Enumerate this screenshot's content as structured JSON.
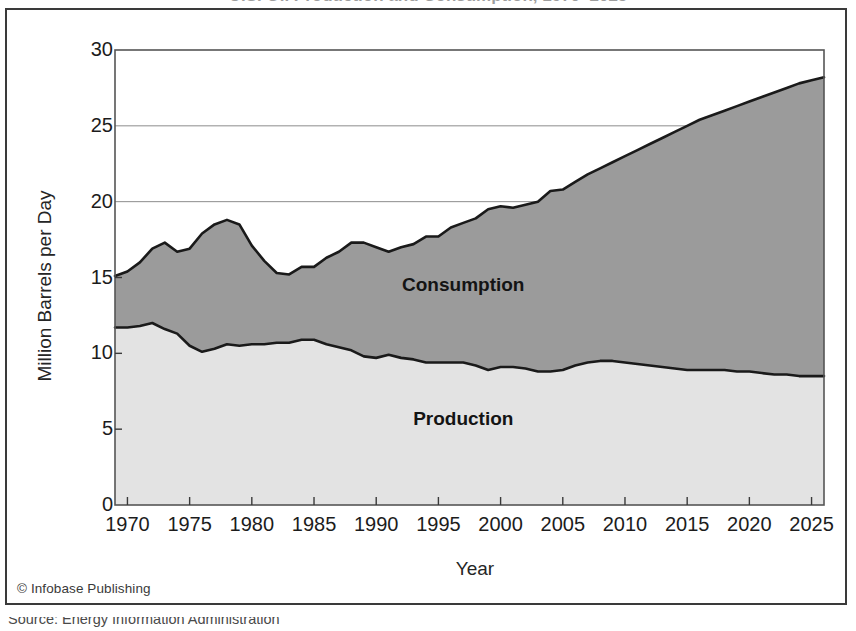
{
  "figure": {
    "title_partial": "U.S. Oil Production and Consumption, 1970–2025",
    "credit": "© Infobase Publishing",
    "source": "Source: Energy Information Administration"
  },
  "chart_data": {
    "type": "area",
    "title": "U.S. Oil Production and Consumption, 1970–2025",
    "xlabel": "Year",
    "ylabel": "Million Barrels per Day",
    "xlim": [
      1969,
      2026
    ],
    "ylim": [
      0,
      30
    ],
    "xticks": [
      1970,
      1975,
      1980,
      1985,
      1990,
      1995,
      2000,
      2005,
      2010,
      2015,
      2020,
      2025
    ],
    "yticks": [
      0,
      5,
      10,
      15,
      20,
      25,
      30
    ],
    "grid": "horizontal",
    "gridlines_at": [
      20,
      25
    ],
    "legend": "inline-area-labels",
    "colors": {
      "consumption_fill": "#9b9b9b",
      "production_fill": "#e3e3e3",
      "line": "#1a1a1a",
      "plot_border": "#555555",
      "frame": "#3a3a3a"
    },
    "annotations": [
      {
        "text": "Consumption",
        "x": 1997,
        "y": 14.1
      },
      {
        "text": "Production",
        "x": 1997,
        "y": 5.3
      }
    ],
    "x": [
      1969,
      1970,
      1971,
      1972,
      1973,
      1974,
      1975,
      1976,
      1977,
      1978,
      1979,
      1980,
      1981,
      1982,
      1983,
      1984,
      1985,
      1986,
      1987,
      1988,
      1989,
      1990,
      1991,
      1992,
      1993,
      1994,
      1995,
      1996,
      1997,
      1998,
      1999,
      2000,
      2001,
      2002,
      2003,
      2004,
      2005,
      2006,
      2007,
      2008,
      2009,
      2010,
      2011,
      2012,
      2013,
      2014,
      2015,
      2016,
      2017,
      2018,
      2019,
      2020,
      2021,
      2022,
      2023,
      2024,
      2025,
      2026
    ],
    "series": [
      {
        "name": "Consumption",
        "values": [
          15.1,
          15.4,
          16.0,
          16.9,
          17.3,
          16.7,
          16.9,
          17.9,
          18.5,
          18.8,
          18.5,
          17.1,
          16.1,
          15.3,
          15.2,
          15.7,
          15.7,
          16.3,
          16.7,
          17.3,
          17.3,
          17.0,
          16.7,
          17.0,
          17.2,
          17.7,
          17.7,
          18.3,
          18.6,
          18.9,
          19.5,
          19.7,
          19.6,
          19.8,
          20.0,
          20.7,
          20.8,
          21.3,
          21.8,
          22.2,
          22.6,
          23.0,
          23.4,
          23.8,
          24.2,
          24.6,
          25.0,
          25.4,
          25.7,
          26.0,
          26.3,
          26.6,
          26.9,
          27.2,
          27.5,
          27.8,
          28.0,
          28.2
        ]
      },
      {
        "name": "Production",
        "values": [
          11.7,
          11.7,
          11.8,
          12.0,
          11.6,
          11.3,
          10.5,
          10.1,
          10.3,
          10.6,
          10.5,
          10.6,
          10.6,
          10.7,
          10.7,
          10.9,
          10.9,
          10.6,
          10.4,
          10.2,
          9.8,
          9.7,
          9.9,
          9.7,
          9.6,
          9.4,
          9.4,
          9.4,
          9.4,
          9.2,
          8.9,
          9.1,
          9.1,
          9.0,
          8.8,
          8.8,
          8.9,
          9.2,
          9.4,
          9.5,
          9.5,
          9.4,
          9.3,
          9.2,
          9.1,
          9.0,
          8.9,
          8.9,
          8.9,
          8.9,
          8.8,
          8.8,
          8.7,
          8.6,
          8.6,
          8.5,
          8.5,
          8.5
        ]
      }
    ]
  }
}
